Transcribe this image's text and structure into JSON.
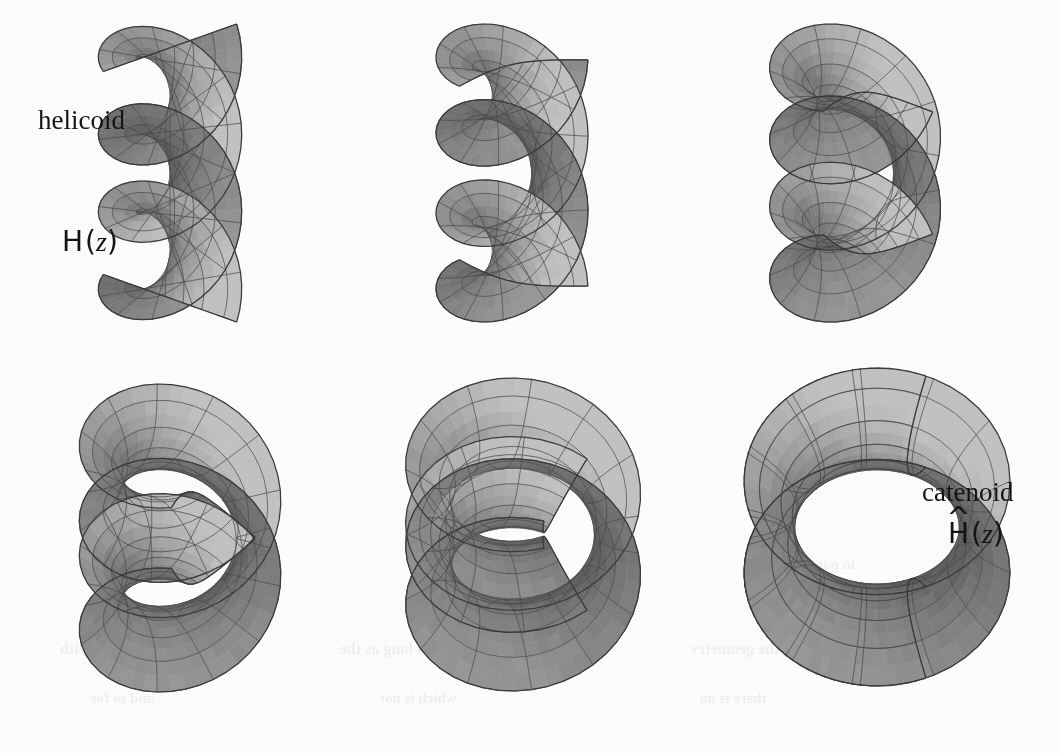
{
  "figure": {
    "background_color": "#fefefe",
    "grid": {
      "rows": 2,
      "cols": 3,
      "panel_count": 6
    },
    "surface_colors": {
      "light": "#c3c3c3",
      "mid": "#a8a8a8",
      "base": "#9a9a9a",
      "dark": "#7c7c7c",
      "darker": "#5e5e5e",
      "deep": "#474747",
      "mesh_line": "#4a4a4a",
      "outline": "#3a3a3a"
    },
    "labels": [
      {
        "id": "helicoid-name",
        "text": "helicoid",
        "style": "serif",
        "x": 38,
        "y": 105,
        "size": 27
      },
      {
        "id": "helicoid-formula",
        "text": "H(z)",
        "style": "formula",
        "x": 62,
        "y": 225,
        "size": 28,
        "hat": false
      },
      {
        "id": "catenoid-name",
        "text": "catenoid",
        "style": "serif",
        "x": 922,
        "y": 477,
        "size": 27
      },
      {
        "id": "catenoid-formula",
        "text": "H(z)",
        "style": "formula",
        "x": 948,
        "y": 517,
        "size": 28,
        "hat": true
      }
    ],
    "panels": [
      {
        "id": "panel-1",
        "index": 1,
        "name": "helicoid",
        "t": 0.0,
        "x": 10,
        "y": 18,
        "w": 320,
        "h": 310,
        "description": "full helicoid, ruled straight lines through vertical axis"
      },
      {
        "id": "panel-2",
        "index": 2,
        "name": "deformation-stage-2",
        "t": 0.22,
        "x": 352,
        "y": 18,
        "w": 320,
        "h": 310,
        "description": "helicoid beginning to bend toward catenoid"
      },
      {
        "id": "panel-3",
        "index": 3,
        "name": "deformation-stage-3",
        "t": 0.44,
        "x": 690,
        "y": 18,
        "w": 330,
        "h": 310,
        "description": "mid deformation, lobes curling into disks"
      },
      {
        "id": "panel-4",
        "index": 4,
        "name": "deformation-stage-4",
        "t": 0.64,
        "x": 20,
        "y": 378,
        "w": 320,
        "h": 320,
        "description": "strongly curled, neck forming"
      },
      {
        "id": "panel-5",
        "index": 5,
        "name": "deformation-stage-5",
        "t": 0.84,
        "x": 358,
        "y": 372,
        "w": 330,
        "h": 325,
        "description": "nearly closed catenoid with residual slit ribbon"
      },
      {
        "id": "panel-6",
        "index": 6,
        "name": "catenoid",
        "t": 1.0,
        "x": 712,
        "y": 362,
        "w": 330,
        "h": 330,
        "description": "complete catenoid, closed surface of revolution"
      }
    ],
    "bleed_through": [
      {
        "text": "in parting heat",
        "x": 760,
        "y": 556,
        "size": 15
      },
      {
        "text": "in the middle of",
        "x": 430,
        "y": 556,
        "size": 15
      },
      {
        "text": "and the word",
        "x": 120,
        "y": 556,
        "size": 15
      },
      {
        "text": "of the geometry",
        "x": 690,
        "y": 640,
        "size": 16
      },
      {
        "text": "as long as the",
        "x": 340,
        "y": 640,
        "size": 16
      },
      {
        "text": "a curve with",
        "x": 60,
        "y": 640,
        "size": 16
      },
      {
        "text": "there is no",
        "x": 700,
        "y": 690,
        "size": 15
      },
      {
        "text": "which is not",
        "x": 380,
        "y": 690,
        "size": 15
      },
      {
        "text": "and so for",
        "x": 90,
        "y": 690,
        "size": 15
      }
    ]
  }
}
